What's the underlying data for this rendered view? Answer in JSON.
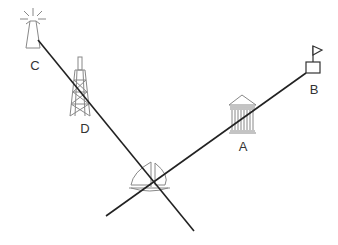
{
  "diagram": {
    "type": "navigation-bearings",
    "background": "#ffffff",
    "line_color": "#222222",
    "icon_color": "#888888",
    "landmarks": [
      {
        "id": "A",
        "label": "A",
        "icon": "bank-building-icon",
        "label_pos": [
          243,
          146
        ]
      },
      {
        "id": "B",
        "label": "B",
        "icon": "flag-marker-icon",
        "label_pos": [
          314,
          89
        ]
      },
      {
        "id": "C",
        "label": "C",
        "icon": "lighthouse-icon",
        "label_pos": [
          35,
          65
        ]
      },
      {
        "id": "D",
        "label": "D",
        "icon": "radio-tower-icon",
        "label_pos": [
          85,
          128
        ]
      }
    ],
    "vessel": {
      "icon": "sailboat-icon",
      "position": [
        150,
        180
      ]
    },
    "bearing_lines": [
      {
        "name": "line-C-D",
        "from": [
          38,
          40
        ],
        "to": [
          194,
          231
        ],
        "through": [
          "C",
          "D"
        ]
      },
      {
        "name": "line-B-A",
        "from": [
          306,
          73
        ],
        "to": [
          106,
          216
        ],
        "through": [
          "B",
          "A"
        ]
      }
    ]
  }
}
